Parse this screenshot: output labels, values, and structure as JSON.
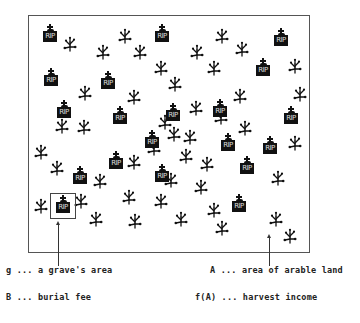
{
  "figure": {
    "grave_text": "RIP",
    "colors": {
      "ink": "#111111",
      "frame": "#555555",
      "background": "#ffffff"
    },
    "graves": [
      {
        "x": 43,
        "y": 24
      },
      {
        "x": 155,
        "y": 24
      },
      {
        "x": 274,
        "y": 28
      },
      {
        "x": 44,
        "y": 68
      },
      {
        "x": 101,
        "y": 71
      },
      {
        "x": 256,
        "y": 58
      },
      {
        "x": 57,
        "y": 100
      },
      {
        "x": 113,
        "y": 106
      },
      {
        "x": 166,
        "y": 103
      },
      {
        "x": 213,
        "y": 99
      },
      {
        "x": 284,
        "y": 106
      },
      {
        "x": 145,
        "y": 130
      },
      {
        "x": 221,
        "y": 133
      },
      {
        "x": 263,
        "y": 136
      },
      {
        "x": 109,
        "y": 151
      },
      {
        "x": 240,
        "y": 156
      },
      {
        "x": 73,
        "y": 166
      },
      {
        "x": 155,
        "y": 164
      },
      {
        "x": 232,
        "y": 194
      },
      {
        "x": 56,
        "y": 195
      }
    ],
    "highlighted_grave_index": 19,
    "plants": [
      {
        "x": 70,
        "y": 44
      },
      {
        "x": 125,
        "y": 36
      },
      {
        "x": 103,
        "y": 52
      },
      {
        "x": 140,
        "y": 52
      },
      {
        "x": 161,
        "y": 68
      },
      {
        "x": 175,
        "y": 84
      },
      {
        "x": 85,
        "y": 93
      },
      {
        "x": 134,
        "y": 97
      },
      {
        "x": 197,
        "y": 52
      },
      {
        "x": 222,
        "y": 36
      },
      {
        "x": 242,
        "y": 49
      },
      {
        "x": 214,
        "y": 68
      },
      {
        "x": 295,
        "y": 66
      },
      {
        "x": 240,
        "y": 96
      },
      {
        "x": 196,
        "y": 108
      },
      {
        "x": 221,
        "y": 117
      },
      {
        "x": 41,
        "y": 152
      },
      {
        "x": 57,
        "y": 168
      },
      {
        "x": 100,
        "y": 181
      },
      {
        "x": 84,
        "y": 127
      },
      {
        "x": 134,
        "y": 162
      },
      {
        "x": 174,
        "y": 134
      },
      {
        "x": 190,
        "y": 137
      },
      {
        "x": 207,
        "y": 164
      },
      {
        "x": 245,
        "y": 128
      },
      {
        "x": 186,
        "y": 156
      },
      {
        "x": 154,
        "y": 148
      },
      {
        "x": 278,
        "y": 178
      },
      {
        "x": 295,
        "y": 143
      },
      {
        "x": 41,
        "y": 206
      },
      {
        "x": 81,
        "y": 201
      },
      {
        "x": 96,
        "y": 219
      },
      {
        "x": 129,
        "y": 197
      },
      {
        "x": 135,
        "y": 221
      },
      {
        "x": 161,
        "y": 201
      },
      {
        "x": 181,
        "y": 219
      },
      {
        "x": 201,
        "y": 187
      },
      {
        "x": 214,
        "y": 210
      },
      {
        "x": 222,
        "y": 228
      },
      {
        "x": 276,
        "y": 219
      },
      {
        "x": 290,
        "y": 236
      },
      {
        "x": 171,
        "y": 180
      },
      {
        "x": 300,
        "y": 94
      },
      {
        "x": 165,
        "y": 122
      },
      {
        "x": 62,
        "y": 126
      }
    ]
  },
  "legend": {
    "g": "g ... a grave's area",
    "A": "A ... area of arable land",
    "B": "B ... burial fee",
    "fA": "f(A) ... harvest income"
  }
}
